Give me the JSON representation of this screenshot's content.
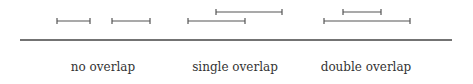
{
  "diagram": {
    "colors": {
      "line": "#555555",
      "baseline": "#444444",
      "text": "#333333"
    },
    "baseline": {
      "x1": 20,
      "x2": 452,
      "y": 40
    },
    "groups": [
      {
        "label": "no overlap",
        "label_x": 103,
        "intervals": [
          {
            "x1": 57,
            "x2": 90,
            "y": 21
          },
          {
            "x1": 112,
            "x2": 150,
            "y": 21
          }
        ]
      },
      {
        "label": "single overlap",
        "label_x": 235,
        "intervals": [
          {
            "x1": 216,
            "x2": 282,
            "y": 12
          },
          {
            "x1": 188,
            "x2": 245,
            "y": 21
          }
        ]
      },
      {
        "label": "double overlap",
        "label_x": 366,
        "intervals": [
          {
            "x1": 343,
            "x2": 381,
            "y": 12
          },
          {
            "x1": 324,
            "x2": 410,
            "y": 21
          }
        ]
      }
    ]
  }
}
